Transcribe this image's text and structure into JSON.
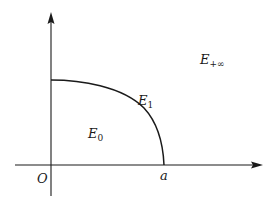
{
  "diagram": {
    "type": "coordinate-region-diagram",
    "axes": {
      "origin_label": "O",
      "x_tick_label": "a"
    },
    "regions": [
      {
        "id": "E0",
        "main": "E",
        "sub": "0"
      },
      {
        "id": "E1",
        "main": "E",
        "sub": "1"
      },
      {
        "id": "Einf",
        "main": "E",
        "sub": "+∞"
      }
    ],
    "colors": {
      "stroke": "#1a1a1a",
      "background": "#ffffff"
    }
  }
}
